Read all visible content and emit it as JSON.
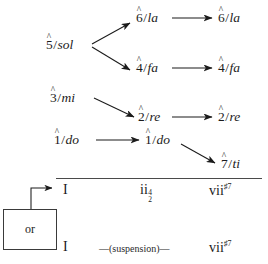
{
  "diagram": {
    "colors": {
      "ink": "#1b1b1b",
      "rule": "#4a4a4a",
      "background": "#ffffff"
    },
    "voices": [
      {
        "id": "sol",
        "degree": "5",
        "hat": "^",
        "separator": "/",
        "syllable": "sol"
      },
      {
        "id": "la-mid",
        "degree": "6",
        "hat": "^",
        "separator": "/",
        "syllable": "la"
      },
      {
        "id": "la-right",
        "degree": "6",
        "hat": "^",
        "separator": "/",
        "syllable": "la"
      },
      {
        "id": "fa-mid",
        "degree": "4",
        "hat": "^",
        "separator": "/",
        "syllable": "fa"
      },
      {
        "id": "fa-right",
        "degree": "4",
        "hat": "^",
        "separator": "/",
        "syllable": "fa"
      },
      {
        "id": "mi",
        "degree": "3",
        "hat": "^",
        "separator": "/",
        "syllable": "mi"
      },
      {
        "id": "re-mid",
        "degree": "2",
        "hat": "^",
        "separator": "/",
        "syllable": "re"
      },
      {
        "id": "re-right",
        "degree": "2",
        "hat": "^",
        "separator": "/",
        "syllable": "re"
      },
      {
        "id": "do-left",
        "degree": "1",
        "hat": "^",
        "separator": "/",
        "syllable": "do"
      },
      {
        "id": "do-mid",
        "degree": "1",
        "hat": "^",
        "separator": "/",
        "syllable": "do"
      },
      {
        "id": "ti-right",
        "degree": "7",
        "hat": "^",
        "separator": "/",
        "syllable": "ti"
      }
    ],
    "harmony": {
      "row_top": {
        "tonic": "I",
        "middle_numeral": "ii",
        "middle_figure_upper": "4",
        "middle_figure_lower": "2",
        "right_numeral": "vii",
        "right_superscript": "♯7"
      },
      "row_bottom": {
        "tonic": "I",
        "middle_label": "—(suspension)—",
        "right_numeral": "vii",
        "right_superscript": "♯7"
      }
    },
    "or_box": {
      "label": "or"
    }
  }
}
